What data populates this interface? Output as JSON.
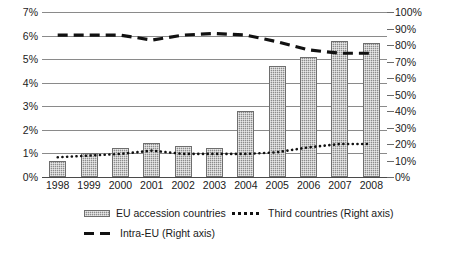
{
  "chart_data": {
    "type": "bar",
    "title": "",
    "subtitle": "",
    "xlabel": "",
    "ylabel": "",
    "y2label": "",
    "grid": true,
    "legend_position": "bottom",
    "categories": [
      "1998",
      "1999",
      "2000",
      "2001",
      "2002",
      "2003",
      "2004",
      "2005",
      "2006",
      "2007",
      "2008"
    ],
    "left_axis": {
      "ticks": [
        "0%",
        "1%",
        "2%",
        "3%",
        "4%",
        "5%",
        "6%",
        "7%"
      ],
      "values": [
        0,
        1,
        2,
        3,
        4,
        5,
        6,
        7
      ],
      "ylim": [
        0,
        7
      ],
      "unit": "%"
    },
    "right_axis": {
      "ticks": [
        "0%",
        "10%",
        "20%",
        "30%",
        "40%",
        "50%",
        "60%",
        "70%",
        "80%",
        "90%",
        "100%"
      ],
      "values": [
        0,
        10,
        20,
        30,
        40,
        50,
        60,
        70,
        80,
        90,
        100
      ],
      "ylim": [
        0,
        100
      ],
      "unit": "%"
    },
    "series": [
      {
        "name": "EU accession countries",
        "type": "bar",
        "axis": "left",
        "values": [
          0.7,
          1.0,
          1.25,
          1.45,
          1.3,
          1.25,
          2.8,
          4.7,
          5.1,
          5.75,
          5.7
        ]
      },
      {
        "name": "Third countries (Right axis)",
        "type": "line",
        "style": "dotted",
        "axis": "right",
        "values": [
          12,
          13,
          14,
          16,
          14,
          14,
          14,
          15,
          18,
          20,
          20
        ]
      },
      {
        "name": "Intra-EU (Right axis)",
        "type": "line",
        "style": "dashed",
        "axis": "right",
        "values": [
          86,
          86,
          86,
          83,
          86,
          87,
          86,
          82,
          77,
          75,
          75
        ]
      }
    ]
  },
  "legend": {
    "items": [
      {
        "label": "EU accession countries",
        "marker": "bar-swatch-icon"
      },
      {
        "label": "Third countries (Right axis)",
        "marker": "dotted-line-icon"
      },
      {
        "label": "Intra-EU (Right axis)",
        "marker": "dashed-line-icon"
      }
    ]
  },
  "colors": {
    "bar_fill": "#8c8c8c",
    "bar_stroke": "#6e6e6e",
    "grid": "#8a8a8a",
    "axis": "#4a4a4a",
    "line": "#111111",
    "background": "#ffffff"
  }
}
